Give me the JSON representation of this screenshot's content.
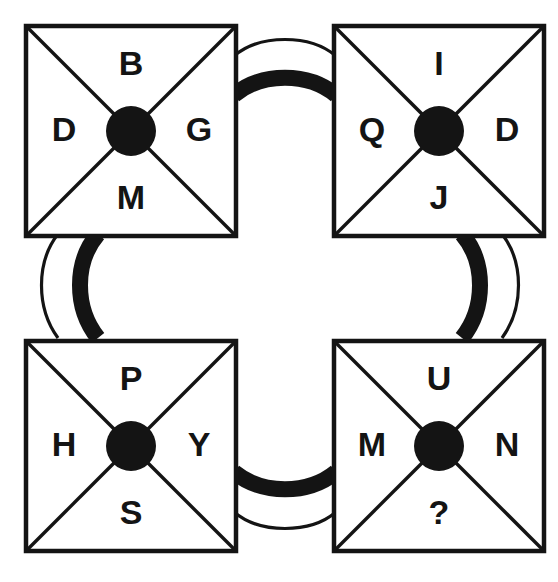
{
  "diagram": {
    "background_color": "#ffffff",
    "ink_color": "#141414",
    "missing_marker": "?",
    "cells": [
      {
        "id": "top-left",
        "position": "top-left",
        "x": 26,
        "y": 26,
        "size": 210,
        "letters": {
          "top": "B",
          "left": "D",
          "right": "G",
          "bottom": "M"
        }
      },
      {
        "id": "top-right",
        "position": "top-right",
        "x": 334,
        "y": 26,
        "size": 210,
        "letters": {
          "top": "I",
          "left": "Q",
          "right": "D",
          "bottom": "J"
        }
      },
      {
        "id": "bottom-left",
        "position": "bottom-left",
        "x": 26,
        "y": 341,
        "size": 210,
        "letters": {
          "top": "P",
          "left": "H",
          "right": "Y",
          "bottom": "S"
        }
      },
      {
        "id": "bottom-right",
        "position": "bottom-right",
        "x": 334,
        "y": 341,
        "size": 210,
        "letters": {
          "top": "U",
          "left": "M",
          "right": "N",
          "bottom": "?"
        }
      }
    ],
    "connectors": [
      {
        "id": "top-connector",
        "orientation": "horizontal",
        "from": "top-left",
        "to": "top-right",
        "thick_side": "lower",
        "thin_side": "upper"
      },
      {
        "id": "left-connector",
        "orientation": "vertical",
        "from": "top-left",
        "to": "bottom-left",
        "thick_side": "right",
        "thin_side": "left"
      },
      {
        "id": "right-connector",
        "orientation": "vertical",
        "from": "top-right",
        "to": "bottom-right",
        "thick_side": "left",
        "thin_side": "right"
      },
      {
        "id": "bottom-connector",
        "orientation": "horizontal",
        "from": "bottom-left",
        "to": "bottom-right",
        "thick_side": "upper",
        "thin_side": "lower"
      }
    ]
  }
}
